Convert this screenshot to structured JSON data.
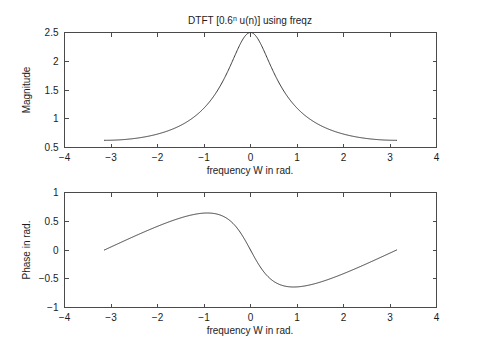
{
  "figure": {
    "width": 477,
    "height": 352,
    "background": "#ffffff",
    "curve_color": "#3b3b3b",
    "axis_color": "#4a4a4a"
  },
  "chart_data": [
    {
      "type": "line",
      "id": "magnitude-plot",
      "title": "DTFT [0.6",
      "title_sup": "n",
      "title_rest": " u(n)] using freqz",
      "title_full": "DTFT [0.6^n u(n)] using freqz",
      "xlabel": "frequency W in rad.",
      "ylabel": "Magnitude",
      "xlim": [
        -4,
        4
      ],
      "ylim": [
        0.5,
        2.5
      ],
      "xticks": [
        -4,
        -3,
        -2,
        -1,
        0,
        1,
        2,
        3,
        4
      ],
      "xticklabels": [
        "−4",
        "−3",
        "−2",
        "−1",
        "0",
        "1",
        "2",
        "3",
        "4"
      ],
      "yticks": [
        0.5,
        1,
        1.5,
        2,
        2.5
      ],
      "yticklabels": [
        "0.5",
        "1",
        "1.5",
        "2",
        "2.5"
      ],
      "grid": false,
      "legend": null,
      "series": [
        {
          "name": "|X(e^{jW})|",
          "formula": "1/sqrt(1 - 1.2*cos(W) + 0.36)",
          "a": 0.6,
          "x_start": -3.14159265,
          "x_end": 3.14159265,
          "n_points": 501,
          "key_points": [
            {
              "x": -3.1416,
              "y": 0.625
            },
            {
              "x": -3.0,
              "y": 0.6266
            },
            {
              "x": -2.5,
              "y": 0.6466
            },
            {
              "x": -2.0,
              "y": 0.6987
            },
            {
              "x": -1.5,
              "y": 0.8054
            },
            {
              "x": -1.0,
              "y": 1.0
            },
            {
              "x": -0.5,
              "y": 1.3744
            },
            {
              "x": -0.25,
              "y": 1.7596
            },
            {
              "x": 0.0,
              "y": 2.5
            },
            {
              "x": 0.25,
              "y": 1.7596
            },
            {
              "x": 0.5,
              "y": 1.3744
            },
            {
              "x": 1.0,
              "y": 1.0
            },
            {
              "x": 1.5,
              "y": 0.8054
            },
            {
              "x": 2.0,
              "y": 0.6987
            },
            {
              "x": 2.5,
              "y": 0.6466
            },
            {
              "x": 3.0,
              "y": 0.6266
            },
            {
              "x": 3.1416,
              "y": 0.625
            }
          ]
        }
      ]
    },
    {
      "type": "line",
      "id": "phase-plot",
      "title": "",
      "xlabel": "frequency W in rad.",
      "ylabel": "Phase in rad.",
      "xlim": [
        -4,
        4
      ],
      "ylim": [
        -1,
        1
      ],
      "xticks": [
        -4,
        -3,
        -2,
        -1,
        0,
        1,
        2,
        3,
        4
      ],
      "xticklabels": [
        "−4",
        "−3",
        "−2",
        "−1",
        "0",
        "1",
        "2",
        "3",
        "4"
      ],
      "yticks": [
        -1,
        -0.5,
        0,
        0.5,
        1
      ],
      "yticklabels": [
        "−1",
        "−0.5",
        "0",
        "0.5",
        "1"
      ],
      "grid": false,
      "legend": null,
      "series": [
        {
          "name": "arg X(e^{jW})",
          "formula": "-atan2(0.6*sin(W), 1 - 0.6*cos(W))",
          "a": 0.6,
          "x_start": -3.14159265,
          "x_end": 3.14159265,
          "n_points": 501,
          "key_points": [
            {
              "x": -3.1416,
              "y": 0.0
            },
            {
              "x": -3.0,
              "y": 0.0529
            },
            {
              "x": -2.5,
              "y": 0.2354
            },
            {
              "x": -2.0,
              "y": 0.4246
            },
            {
              "x": -1.5,
              "y": 0.5729
            },
            {
              "x": -1.0,
              "y": 0.6362
            },
            {
              "x": -0.9273,
              "y": 0.6435
            },
            {
              "x": -0.5,
              "y": 0.5734
            },
            {
              "x": 0.0,
              "y": 0.0
            },
            {
              "x": 0.5,
              "y": -0.5734
            },
            {
              "x": 0.9273,
              "y": -0.6435
            },
            {
              "x": 1.0,
              "y": -0.6362
            },
            {
              "x": 1.5,
              "y": -0.5729
            },
            {
              "x": 2.0,
              "y": -0.4246
            },
            {
              "x": 2.5,
              "y": -0.2354
            },
            {
              "x": 3.0,
              "y": -0.0529
            },
            {
              "x": 3.1416,
              "y": 0.0
            }
          ]
        }
      ]
    }
  ]
}
